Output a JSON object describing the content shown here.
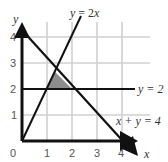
{
  "diagram": {
    "type": "linear-inequality-region",
    "axes": {
      "x_label": "x",
      "y_label": "y",
      "x_ticks": [
        "0",
        "1",
        "2",
        "3",
        "4"
      ],
      "y_ticks": [
        "1",
        "2",
        "3",
        "4"
      ],
      "origin_label": "0"
    },
    "lines": [
      {
        "equation": "y = 2x",
        "label_y": "y",
        "label_eq": " = 2",
        "label_x": "x"
      },
      {
        "equation": "y = 2",
        "label": "y = 2"
      },
      {
        "equation": "x + y = 4",
        "label": "x + y = 4"
      }
    ],
    "shaded_region": {
      "vertices": [
        [
          1,
          2
        ],
        [
          2,
          2
        ],
        [
          1.333,
          2.667
        ]
      ],
      "color": "#8c8c8c"
    },
    "colors": {
      "grid": "#d0d0d0",
      "line": "#111111",
      "shade": "#8c8c8c"
    }
  }
}
